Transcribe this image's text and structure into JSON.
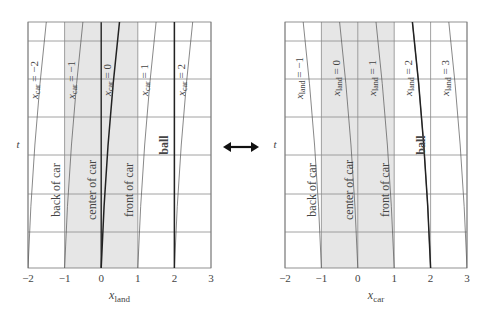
{
  "chart_data": [
    {
      "type": "line",
      "title": "Land frame",
      "xlabel": "x_land",
      "xlabel_main": "x",
      "xlabel_sub": "land",
      "ylabel": "t",
      "xlim": [
        -2,
        3
      ],
      "x_ticks": [
        "−2",
        "−1",
        "0",
        "1",
        "2",
        "3"
      ],
      "grid": true,
      "shaded_region": {
        "from": -1,
        "to": 1,
        "label": "car"
      },
      "lines": [
        {
          "name": "x_car = -2",
          "sub": "car",
          "value": "−2",
          "x_bottom": -2,
          "x_top": -1.5,
          "style": "thin"
        },
        {
          "name": "x_car = -1",
          "sub": "car",
          "value": "−1",
          "x_bottom": -1,
          "x_top": -0.5,
          "style": "thin"
        },
        {
          "name": "x_car = 0",
          "sub": "car",
          "value": "0",
          "x_bottom": 0,
          "x_top": 0.5,
          "style": "thick"
        },
        {
          "name": "x_car = 1",
          "sub": "car",
          "value": "1",
          "x_bottom": 1,
          "x_top": 1.5,
          "style": "thin"
        },
        {
          "name": "x_car = 2",
          "sub": "car",
          "value": "2",
          "x_bottom": 2,
          "x_top": 2.5,
          "style": "thin"
        },
        {
          "name": "ball",
          "x_bottom": 2,
          "x_top": 2,
          "style": "thick"
        }
      ],
      "annotations": [
        "back of car",
        "center of car",
        "front of car",
        "ball"
      ]
    },
    {
      "type": "line",
      "title": "Car frame",
      "xlabel": "x_car",
      "xlabel_main": "x",
      "xlabel_sub": "car",
      "ylabel": "t",
      "xlim": [
        -2,
        3
      ],
      "x_ticks": [
        "−2",
        "−1",
        "0",
        "1",
        "2",
        "3"
      ],
      "grid": true,
      "shaded_region": {
        "from": -1,
        "to": 1,
        "label": "car"
      },
      "lines": [
        {
          "name": "x_land = -1",
          "sub": "land",
          "value": "−1",
          "x_bottom": -1,
          "x_top": -1.5,
          "style": "thin"
        },
        {
          "name": "x_land = 0",
          "sub": "land",
          "value": "0",
          "x_bottom": 0,
          "x_top": -0.5,
          "style": "thin"
        },
        {
          "name": "x_land = 1",
          "sub": "land",
          "value": "1",
          "x_bottom": 1,
          "x_top": 0.5,
          "style": "thin"
        },
        {
          "name": "x_land = 2",
          "sub": "land",
          "value": "2",
          "x_bottom": 2,
          "x_top": 1.5,
          "style": "thin"
        },
        {
          "name": "x_land = 3",
          "sub": "land",
          "value": "3",
          "x_bottom": 3,
          "x_top": 2.5,
          "style": "thin"
        },
        {
          "name": "ball",
          "x_bottom": 2,
          "x_top": 1.5,
          "style": "thick"
        }
      ],
      "annotations": [
        "back of car",
        "center of car",
        "front of car",
        "ball"
      ]
    }
  ],
  "labels": {
    "back": "back of car",
    "center": "center of car",
    "front": "front of car",
    "ball": "ball",
    "t": "t",
    "eq": "="
  },
  "arrow": {
    "icon": "double-arrow-icon",
    "glyph": "↔"
  },
  "colors": {
    "shade": "#e6e6e6",
    "grid": "#8a8a8a",
    "line": "#555555",
    "thick": "#222222"
  }
}
